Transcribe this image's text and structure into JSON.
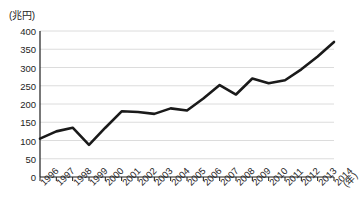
{
  "chart_data": {
    "type": "line",
    "title": "",
    "subtitle": "",
    "xlabel": "(年)",
    "ylabel": "(兆円)",
    "ylim": [
      0,
      400
    ],
    "yticks": [
      0,
      50,
      100,
      150,
      200,
      250,
      300,
      350,
      400
    ],
    "ytick_labels": [
      "0",
      "50",
      "100",
      "150",
      "200",
      "250",
      "300",
      "350",
      "400"
    ],
    "grid": true,
    "grid_axis": "y",
    "legend": false,
    "legend_position": "none",
    "categories": [
      "1996",
      "1997",
      "1998",
      "1999",
      "2000",
      "2001",
      "2002",
      "2003",
      "2004",
      "2005",
      "2006",
      "2007",
      "2008",
      "2009",
      "2010",
      "2011",
      "2012",
      "2013",
      "2014"
    ],
    "x_tick_rotation": -45,
    "series": [
      {
        "name": "",
        "color": "#1a1a1a",
        "line_width": 2.6,
        "values": [
          105,
          125,
          135,
          88,
          135,
          180,
          178,
          173,
          188,
          182,
          215,
          252,
          226,
          270,
          257,
          265,
          295,
          330,
          370
        ]
      }
    ],
    "annotations": [],
    "colors": {
      "line": "#1a1a1a",
      "grid": "#d8d8d8",
      "axis": "#1d1d1d",
      "text": "#1d1d1d",
      "background": "#ffffff"
    }
  }
}
